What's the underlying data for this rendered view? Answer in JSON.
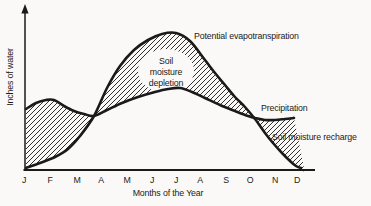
{
  "figure": {
    "background": "#faf9f7",
    "ink": "#1a1a1a"
  },
  "chart_data": {
    "type": "line",
    "title": "",
    "xlabel": "Months of the Year",
    "ylabel": "Inches of water",
    "x_categories": [
      "J",
      "F",
      "M",
      "A",
      "M",
      "J",
      "J",
      "A",
      "S",
      "O",
      "N",
      "D"
    ],
    "grid": "off",
    "legend": "inline labels next to curves",
    "y_axis_note": "no numeric ticks shown; y-axis is a qualitative arrow labeled Inches of water",
    "series": [
      {
        "id": "pet",
        "name": "Potential evapotranspiration",
        "values": [
          0.1,
          0.7,
          2.2,
          5.0,
          8.4,
          9.8,
          10.1,
          8.6,
          6.2,
          4.2,
          1.9,
          0.1
        ],
        "path_px": [
          [
            26,
            168
          ],
          [
            40,
            163
          ],
          [
            55,
            157
          ],
          [
            68,
            149
          ],
          [
            80,
            136
          ],
          [
            94,
            116
          ],
          [
            107,
            88
          ],
          [
            120,
            66
          ],
          [
            134,
            50
          ],
          [
            148,
            40
          ],
          [
            162,
            34
          ],
          [
            176,
            33
          ],
          [
            190,
            41
          ],
          [
            205,
            60
          ],
          [
            215,
            73
          ],
          [
            225,
            85
          ],
          [
            235,
            97
          ],
          [
            245,
            107
          ],
          [
            255,
            119
          ],
          [
            265,
            133
          ],
          [
            273,
            143
          ],
          [
            282,
            153
          ],
          [
            290,
            161
          ],
          [
            296,
            166
          ],
          [
            301,
            168
          ]
        ]
      },
      {
        "id": "precipitation",
        "name": "Precipitation",
        "values": [
          4.5,
          5.2,
          4.3,
          4.2,
          5.1,
          5.7,
          6.0,
          5.5,
          4.7,
          4.0,
          3.7,
          3.9
        ],
        "path_px": [
          [
            26,
            109
          ],
          [
            36,
            103
          ],
          [
            46,
            100
          ],
          [
            54,
            100
          ],
          [
            64,
            106
          ],
          [
            74,
            111
          ],
          [
            84,
            114
          ],
          [
            94,
            116
          ],
          [
            107,
            110
          ],
          [
            122,
            103
          ],
          [
            138,
            97
          ],
          [
            155,
            92
          ],
          [
            168,
            89
          ],
          [
            180,
            88
          ],
          [
            192,
            92
          ],
          [
            205,
            98
          ],
          [
            220,
            105
          ],
          [
            235,
            111
          ],
          [
            248,
            116
          ],
          [
            255,
            118
          ],
          [
            265,
            120
          ],
          [
            275,
            120
          ],
          [
            285,
            119
          ],
          [
            294,
            118
          ]
        ]
      }
    ],
    "regions": [
      {
        "name": "surplus-region",
        "label": "",
        "outline_px": [
          [
            26,
            109
          ],
          [
            36,
            103
          ],
          [
            46,
            100
          ],
          [
            54,
            100
          ],
          [
            64,
            106
          ],
          [
            74,
            111
          ],
          [
            84,
            114
          ],
          [
            94,
            116
          ],
          [
            94,
            116
          ],
          [
            80,
            136
          ],
          [
            68,
            149
          ],
          [
            55,
            157
          ],
          [
            40,
            163
          ],
          [
            26,
            168
          ]
        ]
      },
      {
        "name": "depletion-region",
        "label": "Soil moisture depletion",
        "label_lines": [
          "Soil",
          "moisture",
          "depletion"
        ],
        "outline_px": [
          [
            94,
            116
          ],
          [
            107,
            88
          ],
          [
            120,
            66
          ],
          [
            134,
            50
          ],
          [
            148,
            40
          ],
          [
            162,
            34
          ],
          [
            176,
            33
          ],
          [
            190,
            41
          ],
          [
            205,
            60
          ],
          [
            215,
            73
          ],
          [
            225,
            85
          ],
          [
            235,
            97
          ],
          [
            245,
            107
          ],
          [
            255,
            119
          ],
          [
            255,
            119
          ],
          [
            248,
            116
          ],
          [
            235,
            111
          ],
          [
            220,
            105
          ],
          [
            205,
            98
          ],
          [
            192,
            92
          ],
          [
            180,
            88
          ],
          [
            168,
            89
          ],
          [
            155,
            92
          ],
          [
            138,
            97
          ],
          [
            122,
            103
          ],
          [
            107,
            110
          ]
        ]
      },
      {
        "name": "recharge-region",
        "label": "Soil moisture recharge",
        "outline_px": [
          [
            255,
            118
          ],
          [
            265,
            120
          ],
          [
            275,
            120
          ],
          [
            285,
            119
          ],
          [
            294,
            118
          ],
          [
            294,
            118
          ],
          [
            304,
            168
          ],
          [
            301,
            168
          ],
          [
            296,
            166
          ],
          [
            290,
            161
          ],
          [
            282,
            153
          ],
          [
            273,
            143
          ],
          [
            265,
            133
          ],
          [
            255,
            119
          ]
        ]
      }
    ],
    "layout": {
      "months_x_px": [
        24,
        50,
        77,
        101,
        127,
        152,
        176,
        200,
        226,
        250,
        275,
        297
      ],
      "month_label_y_px": 182.5
    }
  }
}
